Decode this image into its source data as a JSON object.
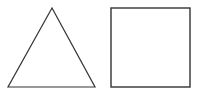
{
  "diagram": {
    "shapes": [
      {
        "type": "triangle",
        "points": "52,8 8,87 95,87",
        "stroke": "#333333",
        "fill": "#ffffff",
        "stroke_width": 1.2
      },
      {
        "type": "square",
        "x": 111,
        "y": 8,
        "width": 79,
        "height": 79,
        "stroke": "#333333",
        "fill": "#ffffff",
        "stroke_width": 1.4
      }
    ]
  }
}
